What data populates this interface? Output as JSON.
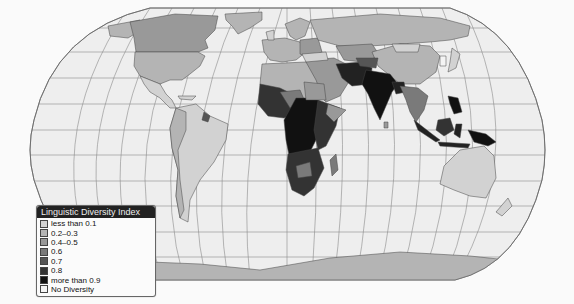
{
  "map": {
    "title": "Linguistic Diversity Index",
    "projection": "Robinson",
    "colors": {
      "ocean": "#eeeeee",
      "graticule": "#8a8a8a",
      "border": "#444444"
    }
  },
  "legend": {
    "title": "Linguistic Diversity Index",
    "items": [
      {
        "label": "less than 0.1",
        "color": "#d2d2d2"
      },
      {
        "label": "0.2–0.3",
        "color": "#b4b4b4"
      },
      {
        "label": "0.4–0.5",
        "color": "#999999"
      },
      {
        "label": "0.6",
        "color": "#7a7a7a"
      },
      {
        "label": "0.7",
        "color": "#555555"
      },
      {
        "label": "0.8",
        "color": "#333333"
      },
      {
        "label": "more than 0.9",
        "color": "#111111"
      },
      {
        "label": "No Diversity",
        "color": "#f4f4f4"
      }
    ]
  }
}
